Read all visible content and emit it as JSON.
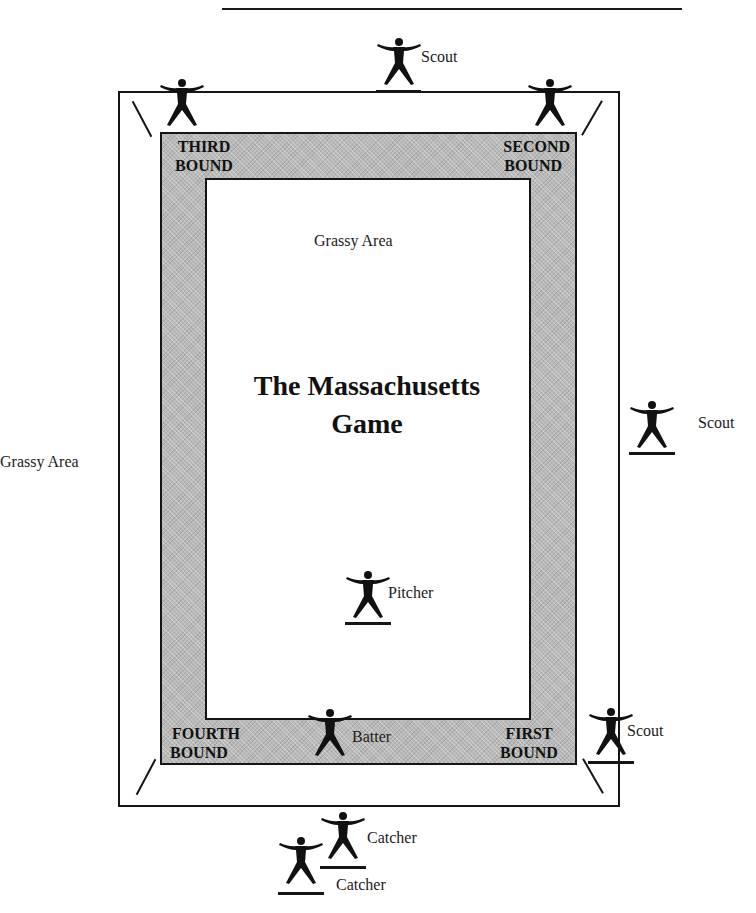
{
  "header": {
    "text": "Chapter 1 · 15"
  },
  "diagram": {
    "title_line1": "The Massachusetts",
    "title_line2": "Game",
    "inner_area_label": "Grassy Area",
    "outer_area_label": "Grassy Area",
    "bounds": {
      "third": {
        "line1": "THIRD",
        "line2": "BOUND"
      },
      "second": {
        "line1": "SECOND",
        "line2": "BOUND"
      },
      "fourth": {
        "line1": "FOURTH",
        "line2": "BOUND"
      },
      "first": {
        "line1": "FIRST",
        "line2": "BOUND"
      }
    },
    "players": {
      "scout_top": "Scout",
      "scout_right": "Scout",
      "scout_bottom_right": "Scout",
      "pitcher": "Pitcher",
      "batter": "Batter",
      "catcher_1": "Catcher",
      "catcher_2": "Catcher"
    },
    "colors": {
      "line": "#151515",
      "band_fill": "#b9b9b9",
      "background": "#ffffff"
    }
  }
}
